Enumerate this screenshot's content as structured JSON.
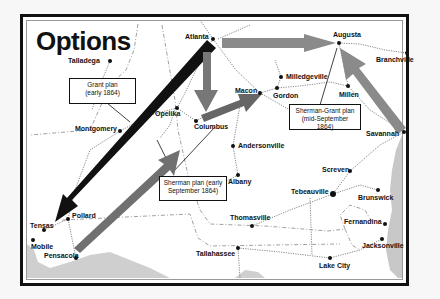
{
  "title": "Options",
  "colors": {
    "grant_arrow": "#111111",
    "sherman_arrow": "#777777",
    "sherman_grant_arrow": "#8a8a8a",
    "coast": "#c8c8c8",
    "railroad": "#888888",
    "border": "#111111"
  },
  "callouts": {
    "grant": {
      "line1": "Grant plan",
      "line2": "(early 1864)"
    },
    "sherman": {
      "line1": "Sherman plan (early",
      "line2": "September 1864)"
    },
    "sherman_grant": {
      "line1": "Sherman-Grant plan",
      "line2": "(mid-September 1864)"
    }
  },
  "cities": [
    {
      "name": "Talladega",
      "x": 110,
      "y": 61,
      "dx": -42,
      "dy": -4
    },
    {
      "name": "Atlanta",
      "x": 213,
      "y": 39,
      "dx": -28,
      "dy": -6
    },
    {
      "name": "Augusta",
      "x": 339,
      "y": 43,
      "dx": -6,
      "dy": -12
    },
    {
      "name": "Branchville",
      "x": 407,
      "y": 53,
      "dx": -31,
      "dy": 3
    },
    {
      "name": "Milledgeville",
      "x": 281,
      "y": 77,
      "dx": 5,
      "dy": -4
    },
    {
      "name": "Macon",
      "x": 260,
      "y": 93,
      "dx": -25,
      "dy": -6
    },
    {
      "name": "Gordon",
      "x": 277,
      "y": 88,
      "dx": -4,
      "dy": 4
    },
    {
      "name": "Millen",
      "x": 348,
      "y": 86,
      "dx": -9,
      "dy": 5
    },
    {
      "name": "Opelika",
      "x": 177,
      "y": 108,
      "dx": -22,
      "dy": 2
    },
    {
      "name": "Columbus",
      "x": 196,
      "y": 121,
      "dx": -2,
      "dy": 2
    },
    {
      "name": "Montgomery",
      "x": 120,
      "y": 131,
      "dx": -45,
      "dy": -6
    },
    {
      "name": "Savannah",
      "x": 404,
      "y": 132,
      "dx": -38,
      "dy": -2
    },
    {
      "name": "Andersonville",
      "x": 233,
      "y": 146,
      "dx": 5,
      "dy": -4
    },
    {
      "name": "Albany",
      "x": 238,
      "y": 175,
      "dx": -10,
      "dy": 3
    },
    {
      "name": "Screven",
      "x": 350,
      "y": 171,
      "dx": -28,
      "dy": -5
    },
    {
      "name": "Tebeauville",
      "x": 333,
      "y": 194,
      "dx": -42,
      "dy": -6
    },
    {
      "name": "Brunswick",
      "x": 378,
      "y": 190,
      "dx": -20,
      "dy": 4
    },
    {
      "name": "Thomasville",
      "x": 252,
      "y": 226,
      "dx": -22,
      "dy": -12
    },
    {
      "name": "Fernandina",
      "x": 385,
      "y": 224,
      "dx": -41,
      "dy": -6
    },
    {
      "name": "Jacksonville",
      "x": 382,
      "y": 239,
      "dx": -20,
      "dy": 3
    },
    {
      "name": "Tallahassee",
      "x": 238,
      "y": 248,
      "dx": -42,
      "dy": 2
    },
    {
      "name": "Lake City",
      "x": 330,
      "y": 258,
      "dx": -11,
      "dy": 4
    },
    {
      "name": "Pollard",
      "x": 68,
      "y": 219,
      "dx": 4,
      "dy": -7
    },
    {
      "name": "Tensas",
      "x": 44,
      "y": 230,
      "dx": -14,
      "dy": -8
    },
    {
      "name": "Mobile",
      "x": 33,
      "y": 240,
      "dx": -2,
      "dy": 3
    },
    {
      "name": "Pensacola",
      "x": 76,
      "y": 258,
      "dx": -32,
      "dy": -6
    }
  ]
}
